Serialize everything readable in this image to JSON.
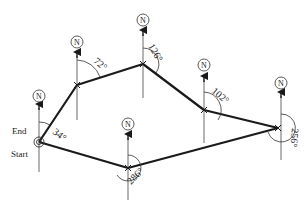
{
  "diagram": {
    "type": "traverse-bearing-diagram",
    "north_label": "N",
    "labels": {
      "start": "Start",
      "end": "End"
    },
    "stations": [
      {
        "id": "A",
        "role": "start/end",
        "x": 39,
        "y": 142,
        "bearing": "34°"
      },
      {
        "id": "B",
        "x": 77,
        "y": 85,
        "bearing": "72°"
      },
      {
        "id": "C",
        "x": 143,
        "y": 64,
        "bearing": "126°"
      },
      {
        "id": "D",
        "x": 204,
        "y": 110,
        "bearing": "102°"
      },
      {
        "id": "E",
        "x": 278,
        "y": 128,
        "bearing": "256°"
      },
      {
        "id": "F",
        "x": 128,
        "y": 168,
        "bearing": "286°"
      }
    ],
    "angle_labels": {
      "a": "34°",
      "b": "72°",
      "c": "126°",
      "d": "102°",
      "e": "256°",
      "f": "286°"
    },
    "colors": {
      "line": "#1a1a1a",
      "text": "#222222",
      "background": "#ffffff"
    }
  }
}
